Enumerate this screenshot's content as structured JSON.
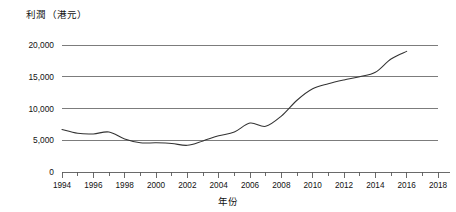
{
  "chart_data": {
    "type": "line",
    "title": "",
    "ylabel": "利潤（港元）",
    "xlabel": "年份",
    "ylim": [
      0,
      20000
    ],
    "xlim": [
      1994,
      2018
    ],
    "grid": true,
    "legend_position": "none",
    "y_ticks": [
      "0",
      "5,000",
      "10,000",
      "15,000",
      "20,000"
    ],
    "y_tick_values": [
      0,
      5000,
      10000,
      15000,
      20000
    ],
    "x_ticks": [
      "1994",
      "1996",
      "1998",
      "2000",
      "2002",
      "2004",
      "2006",
      "2008",
      "2010",
      "2012",
      "2014",
      "2016",
      "2018"
    ],
    "x_tick_values": [
      1994,
      1996,
      1998,
      2000,
      2002,
      2004,
      2006,
      2008,
      2010,
      2012,
      2014,
      2016,
      2018
    ],
    "x_minor_tick_values": [
      1995,
      1997,
      1999,
      2001,
      2003,
      2005,
      2007,
      2009,
      2011,
      2013,
      2015,
      2017
    ],
    "line_color": "#333333",
    "series": [
      {
        "name": "利潤",
        "x": [
          1994,
          1995,
          1996,
          1997,
          1998,
          1999,
          2000,
          2001,
          2002,
          2003,
          2004,
          2005,
          2006,
          2007,
          2008,
          2009,
          2010,
          2011,
          2012,
          2013,
          2014,
          2015,
          2016
        ],
        "values": [
          6700,
          6100,
          6000,
          6300,
          5200,
          4600,
          4600,
          4500,
          4200,
          4900,
          5700,
          6300,
          7700,
          7200,
          8800,
          11300,
          13100,
          13900,
          14500,
          15000,
          15700,
          17800,
          19000
        ]
      }
    ]
  },
  "colors": {
    "accent": "#333333",
    "gridline": "#6e6e6e",
    "axis": "#5a5a5a",
    "text": "#111111",
    "background": "#ffffff"
  }
}
